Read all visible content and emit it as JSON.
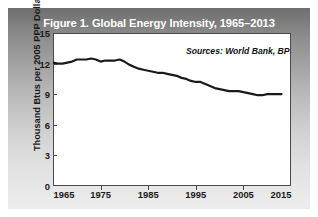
{
  "figure": {
    "title": "Figure 1. Global Energy Intensity, 1965–2013",
    "source_note": "Sources: World Bank, BP"
  },
  "chart_data": {
    "type": "line",
    "title": "Figure 1. Global Energy Intensity, 1965–2013",
    "xlabel": "",
    "ylabel": "Thousand Btus per 2005 PPP Dollars",
    "xlim": [
      1965,
      2015
    ],
    "ylim": [
      0,
      15
    ],
    "xticks": [
      1965,
      1975,
      1985,
      1995,
      2005,
      2015
    ],
    "yticks": [
      0,
      3,
      6,
      9,
      12,
      15
    ],
    "grid": false,
    "legend": null,
    "annotations": [
      "Sources: World Bank, BP"
    ],
    "series": [
      {
        "name": "Global Energy Intensity",
        "color": "#1a1a1a",
        "x": [
          1965,
          1966,
          1967,
          1968,
          1969,
          1970,
          1971,
          1972,
          1973,
          1974,
          1975,
          1976,
          1977,
          1978,
          1979,
          1980,
          1981,
          1982,
          1983,
          1984,
          1985,
          1986,
          1987,
          1988,
          1989,
          1990,
          1991,
          1992,
          1993,
          1994,
          1995,
          1996,
          1997,
          1998,
          1999,
          2000,
          2001,
          2002,
          2003,
          2004,
          2005,
          2006,
          2007,
          2008,
          2009,
          2010,
          2011,
          2012,
          2013
        ],
        "values": [
          12.1,
          12.0,
          12.0,
          12.1,
          12.2,
          12.4,
          12.4,
          12.4,
          12.5,
          12.4,
          12.2,
          12.3,
          12.3,
          12.3,
          12.4,
          12.2,
          11.9,
          11.7,
          11.5,
          11.4,
          11.3,
          11.2,
          11.1,
          11.1,
          11.0,
          10.9,
          10.8,
          10.6,
          10.5,
          10.3,
          10.2,
          10.2,
          10.0,
          9.8,
          9.6,
          9.5,
          9.4,
          9.3,
          9.3,
          9.3,
          9.2,
          9.1,
          9.0,
          8.9,
          8.9,
          9.0,
          9.0,
          9.0,
          9.0
        ]
      }
    ]
  },
  "axes": {
    "y_title": "Thousand Btus per 2005 PPP Dollars",
    "y_ticks": [
      "15",
      "12",
      "9",
      "6",
      "3",
      "0"
    ],
    "x_ticks": [
      "1965",
      "1975",
      "1985",
      "1995",
      "2005",
      "2015"
    ]
  }
}
